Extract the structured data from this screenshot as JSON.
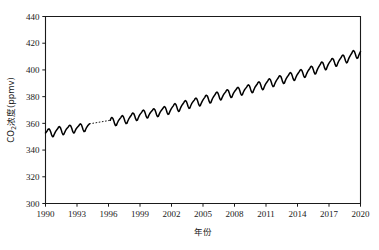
{
  "chart_data": {
    "type": "line",
    "title": "",
    "subtitle": "",
    "xlabel": "年份",
    "ylabel": "CO₂浓度(ppmv)",
    "ylabel_parts": {
      "prefix": "CO",
      "subscript": "2",
      "suffix": "浓度(ppmv)"
    },
    "xlim": [
      1990,
      2020
    ],
    "ylim": [
      300,
      440
    ],
    "grid": false,
    "legend": "none",
    "line_color": "#000000",
    "axis_color": "#1a1a1a",
    "background_color": "#ffffff",
    "x_ticks": [
      1990,
      1993,
      1996,
      1999,
      2002,
      2005,
      2008,
      2011,
      2014,
      2017,
      2020
    ],
    "x_tick_labels": [
      "1990",
      "1993",
      "1996",
      "1999",
      "2002",
      "2005",
      "2008",
      "2011",
      "2014",
      "2017",
      "2020"
    ],
    "y_ticks": [
      300,
      320,
      340,
      360,
      380,
      400,
      420,
      440
    ],
    "y_tick_labels": [
      "300",
      "320",
      "340",
      "360",
      "380",
      "400",
      "420",
      "440"
    ],
    "series": [
      {
        "name": "CO2 concentration (observed)",
        "style": "solid",
        "note": "monthly-mean CO2 with seasonal cycle",
        "x": [
          1990.0,
          1990.08,
          1990.17,
          1990.25,
          1990.33,
          1990.42,
          1990.5,
          1990.58,
          1990.67,
          1990.75,
          1990.83,
          1990.92,
          1991.0,
          1991.08,
          1991.17,
          1991.25,
          1991.33,
          1991.42,
          1991.5,
          1991.58,
          1991.67,
          1991.75,
          1991.83,
          1991.92,
          1992.0,
          1992.08,
          1992.17,
          1992.25,
          1992.33,
          1992.42,
          1992.5,
          1992.58,
          1992.67,
          1992.75,
          1992.83,
          1992.92,
          1993.0,
          1993.08,
          1993.17,
          1993.25,
          1993.33,
          1993.42,
          1993.5,
          1993.58,
          1993.67,
          1993.75,
          1993.83,
          1993.92,
          1994.0,
          1994.08,
          1994.17
        ],
        "y": [
          352.8,
          353.6,
          354.5,
          355.6,
          355.9,
          355.1,
          353.5,
          351.4,
          350.0,
          350.2,
          351.8,
          353.2,
          354.4,
          355.2,
          356.1,
          357.3,
          357.6,
          356.8,
          355.1,
          353.0,
          351.5,
          351.8,
          353.3,
          354.8,
          355.8,
          356.5,
          357.3,
          358.3,
          358.6,
          357.9,
          356.3,
          354.2,
          352.8,
          353.0,
          354.5,
          355.9,
          356.7,
          357.4,
          358.2,
          359.3,
          359.7,
          359.0,
          357.3,
          355.2,
          353.8,
          354.0,
          355.6,
          357.0,
          358.0,
          358.8,
          359.6
        ]
      },
      {
        "name": "CO2 concentration (gap interpolation)",
        "style": "dashed",
        "note": "dotted connector across missing data 1994.2-1996.2",
        "x": [
          1994.17,
          1996.17
        ],
        "y": [
          359.6,
          362.3
        ]
      },
      {
        "name": "CO2 concentration (observed, continued)",
        "style": "solid",
        "note": "monthly-mean CO2 with seasonal cycle",
        "x": [
          1996.17,
          1996.25,
          1996.33,
          1996.42,
          1996.5,
          1996.58,
          1996.67,
          1996.75,
          1996.83,
          1996.92,
          1997.0,
          1997.08,
          1997.17,
          1997.25,
          1997.33,
          1997.42,
          1997.5,
          1997.58,
          1997.67,
          1997.75,
          1997.83,
          1997.92,
          1998.0,
          1998.08,
          1998.17,
          1998.25,
          1998.33,
          1998.42,
          1998.5,
          1998.58,
          1998.67,
          1998.75,
          1998.83,
          1998.92,
          1999.0,
          1999.08,
          1999.17,
          1999.25,
          1999.33,
          1999.42,
          1999.5,
          1999.58,
          1999.67,
          1999.75,
          1999.83,
          1999.92,
          2000.0,
          2000.08,
          2000.17,
          2000.25,
          2000.33,
          2000.42,
          2000.5,
          2000.58,
          2000.67,
          2000.75,
          2000.83,
          2000.92,
          2001.0,
          2001.08,
          2001.17,
          2001.25,
          2001.33,
          2001.42,
          2001.5,
          2001.58,
          2001.67,
          2001.75,
          2001.83,
          2001.92,
          2002.0,
          2002.08,
          2002.17,
          2002.25,
          2002.33,
          2002.42,
          2002.5,
          2002.58,
          2002.67,
          2002.75,
          2002.83,
          2002.92,
          2003.0,
          2003.08,
          2003.17,
          2003.25,
          2003.33,
          2003.42,
          2003.5,
          2003.58,
          2003.67,
          2003.75,
          2003.83,
          2003.92,
          2004.0,
          2004.08,
          2004.17,
          2004.25,
          2004.33,
          2004.42,
          2004.5,
          2004.58,
          2004.67,
          2004.75,
          2004.83,
          2004.92,
          2005.0,
          2005.08,
          2005.17,
          2005.25,
          2005.33,
          2005.42,
          2005.5,
          2005.58,
          2005.67,
          2005.75,
          2005.83,
          2005.92,
          2006.0,
          2006.08,
          2006.17,
          2006.25,
          2006.33,
          2006.42,
          2006.5,
          2006.58,
          2006.67,
          2006.75,
          2006.83,
          2006.92,
          2007.0,
          2007.08,
          2007.17,
          2007.25,
          2007.33,
          2007.42,
          2007.5,
          2007.58,
          2007.67,
          2007.75,
          2007.83,
          2007.92,
          2008.0,
          2008.08,
          2008.17,
          2008.25,
          2008.33,
          2008.42,
          2008.5,
          2008.58,
          2008.67,
          2008.75,
          2008.83,
          2008.92,
          2009.0,
          2009.08,
          2009.17,
          2009.25,
          2009.33,
          2009.42,
          2009.5,
          2009.58,
          2009.67,
          2009.75,
          2009.83,
          2009.92,
          2010.0,
          2010.08,
          2010.17,
          2010.25,
          2010.33,
          2010.42,
          2010.5,
          2010.58,
          2010.67,
          2010.75,
          2010.83,
          2010.92,
          2011.0,
          2011.08,
          2011.17,
          2011.25,
          2011.33,
          2011.42,
          2011.5,
          2011.58,
          2011.67,
          2011.75,
          2011.83,
          2011.92,
          2012.0,
          2012.08,
          2012.17,
          2012.25,
          2012.33,
          2012.42,
          2012.5,
          2012.58,
          2012.67,
          2012.75,
          2012.83,
          2012.92,
          2013.0,
          2013.08,
          2013.17,
          2013.25,
          2013.33,
          2013.42,
          2013.5,
          2013.58,
          2013.67,
          2013.75,
          2013.83,
          2013.92,
          2014.0,
          2014.08,
          2014.17,
          2014.25,
          2014.33,
          2014.42,
          2014.5,
          2014.58,
          2014.67,
          2014.75,
          2014.83,
          2014.92,
          2015.0,
          2015.08,
          2015.17,
          2015.25,
          2015.33,
          2015.42,
          2015.5,
          2015.58,
          2015.67,
          2015.75,
          2015.83,
          2015.92,
          2016.0,
          2016.08,
          2016.17,
          2016.25,
          2016.33,
          2016.42,
          2016.5,
          2016.58,
          2016.67,
          2016.75,
          2016.83,
          2016.92,
          2017.0,
          2017.08,
          2017.17,
          2017.25,
          2017.33,
          2017.42,
          2017.5,
          2017.58,
          2017.67,
          2017.75,
          2017.83,
          2017.92,
          2018.0,
          2018.08,
          2018.17,
          2018.25,
          2018.33,
          2018.42,
          2018.5,
          2018.58,
          2018.67,
          2018.75,
          2018.83,
          2018.92,
          2019.0,
          2019.08,
          2019.17,
          2019.25,
          2019.33,
          2019.42,
          2019.5,
          2019.58,
          2019.67,
          2019.75,
          2019.83,
          2019.92,
          2020.0
        ],
        "y": [
          362.3,
          364.0,
          364.4,
          363.6,
          361.9,
          359.8,
          358.3,
          358.5,
          360.1,
          361.6,
          362.6,
          363.4,
          364.3,
          365.4,
          365.8,
          365.0,
          363.3,
          361.2,
          359.8,
          360.0,
          361.6,
          363.1,
          364.2,
          365.1,
          366.1,
          367.3,
          367.8,
          367.1,
          365.5,
          363.5,
          362.1,
          362.4,
          364.0,
          365.6,
          366.7,
          367.5,
          368.4,
          369.5,
          369.9,
          369.2,
          367.5,
          365.4,
          364.0,
          364.2,
          365.8,
          367.2,
          368.1,
          368.8,
          369.6,
          370.7,
          371.0,
          370.2,
          368.5,
          366.4,
          365.0,
          365.3,
          366.9,
          368.4,
          369.4,
          370.2,
          371.1,
          372.2,
          372.6,
          371.9,
          370.2,
          368.1,
          366.7,
          367.0,
          368.6,
          370.1,
          371.2,
          372.1,
          373.1,
          374.3,
          374.8,
          374.1,
          372.4,
          370.3,
          368.9,
          369.2,
          370.9,
          372.5,
          373.6,
          374.5,
          375.5,
          376.7,
          377.1,
          376.4,
          374.7,
          372.6,
          371.2,
          371.5,
          373.2,
          374.7,
          375.7,
          376.5,
          377.4,
          378.5,
          378.9,
          378.2,
          376.5,
          374.4,
          373.0,
          373.3,
          375.0,
          376.5,
          377.6,
          378.5,
          379.5,
          380.7,
          381.1,
          380.4,
          378.7,
          376.6,
          375.2,
          375.5,
          377.2,
          378.8,
          379.9,
          380.8,
          381.8,
          383.0,
          383.4,
          382.7,
          381.0,
          378.9,
          377.5,
          377.8,
          379.5,
          381.0,
          382.0,
          382.8,
          383.7,
          384.8,
          385.2,
          384.5,
          382.8,
          380.7,
          379.3,
          379.6,
          381.3,
          382.8,
          383.8,
          384.6,
          385.5,
          386.6,
          387.0,
          386.3,
          384.6,
          382.5,
          381.1,
          381.4,
          383.1,
          384.6,
          385.6,
          386.4,
          387.3,
          388.4,
          388.8,
          388.1,
          386.4,
          384.3,
          382.9,
          383.2,
          384.9,
          386.5,
          387.6,
          388.5,
          389.5,
          390.7,
          391.1,
          390.4,
          388.7,
          386.6,
          385.2,
          385.5,
          387.2,
          388.8,
          389.9,
          390.8,
          391.8,
          393.0,
          393.4,
          392.7,
          391.0,
          388.9,
          387.5,
          387.8,
          389.5,
          391.1,
          392.2,
          393.1,
          394.1,
          395.3,
          395.7,
          395.0,
          393.3,
          391.2,
          389.8,
          390.1,
          391.8,
          393.4,
          394.5,
          395.4,
          396.4,
          397.6,
          398.0,
          397.3,
          395.6,
          393.5,
          392.1,
          392.4,
          394.1,
          395.7,
          396.8,
          397.7,
          398.7,
          399.9,
          400.3,
          399.6,
          397.9,
          395.8,
          394.4,
          394.7,
          396.4,
          398.0,
          399.2,
          400.1,
          401.1,
          402.3,
          402.8,
          402.1,
          400.4,
          398.3,
          396.9,
          397.3,
          399.1,
          400.8,
          402.0,
          403.0,
          404.1,
          405.5,
          406.0,
          405.3,
          403.6,
          401.5,
          400.1,
          400.5,
          402.3,
          404.0,
          405.1,
          406.0,
          407.0,
          408.2,
          408.6,
          407.9,
          406.2,
          404.1,
          402.7,
          403.1,
          404.9,
          406.5,
          407.6,
          408.5,
          409.5,
          410.7,
          411.2,
          410.5,
          408.8,
          406.7,
          405.3,
          405.7,
          407.5,
          409.2,
          410.4,
          411.4,
          412.5,
          413.9,
          414.5,
          413.8,
          412.1,
          410.0,
          408.6,
          409.0,
          410.8,
          412.5,
          413.8
        ]
      }
    ]
  },
  "annotations": {
    "start_value_ppmv": "352.8",
    "end_value_ppmv": "413.8",
    "peak_value_ppmv": "414.5",
    "seasonal_amplitude_ppmv": "6.5",
    "data_gap_start_year": "1994",
    "data_gap_end_year": "1996"
  }
}
